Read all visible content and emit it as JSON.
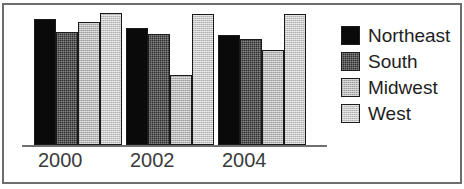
{
  "chart_data": {
    "type": "bar",
    "title": "",
    "xlabel": "",
    "ylabel": "",
    "categories": [
      "2000",
      "2002",
      "2004"
    ],
    "series": [
      {
        "name": "Northeast",
        "values": [
          126,
          117,
          110
        ],
        "color": "#0a0a0a",
        "fill": "solid-black"
      },
      {
        "name": "South",
        "values": [
          113,
          111,
          106
        ],
        "color": "#2f2f2f",
        "fill": "dark-stipple"
      },
      {
        "name": "Midwest",
        "values": [
          123,
          70,
          95
        ],
        "color": "#b9b9b9",
        "fill": "light-stipple"
      },
      {
        "name": "West",
        "values": [
          132,
          131,
          131
        ],
        "color": "#c6c6c6",
        "fill": "very-light-stipple"
      }
    ],
    "ylim": [
      0,
      139
    ],
    "grid": false,
    "legend_position": "right",
    "axis_visible": {
      "x": true,
      "y": false
    }
  },
  "legend": {
    "items": [
      {
        "label": "Northeast",
        "swatch": "swatch-northeast"
      },
      {
        "label": "South",
        "swatch": "swatch-south"
      },
      {
        "label": "Midwest",
        "swatch": "swatch-midwest"
      },
      {
        "label": "West",
        "swatch": "swatch-west"
      }
    ]
  },
  "axis": {
    "tick_labels": [
      "2000",
      "2002",
      "2004"
    ]
  }
}
